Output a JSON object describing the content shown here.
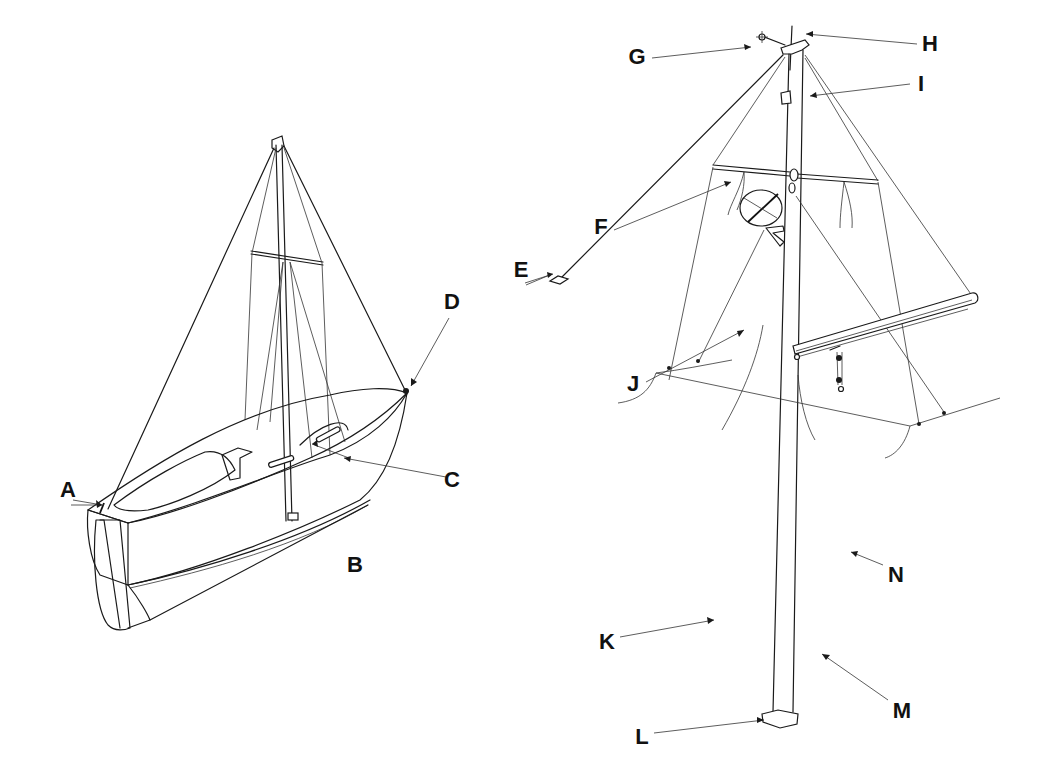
{
  "figure": {
    "colors": {
      "ink": "#1a1a1a",
      "background": "#ffffff"
    }
  },
  "labels": [
    {
      "id": "A",
      "text": "A",
      "x": 68,
      "y": 490
    },
    {
      "id": "B",
      "text": "B",
      "x": 355,
      "y": 565
    },
    {
      "id": "C",
      "text": "C",
      "x": 452,
      "y": 480
    },
    {
      "id": "D",
      "text": "D",
      "x": 452,
      "y": 302
    },
    {
      "id": "E",
      "text": "E",
      "x": 521,
      "y": 270
    },
    {
      "id": "F",
      "text": "F",
      "x": 601,
      "y": 227
    },
    {
      "id": "G",
      "text": "G",
      "x": 637,
      "y": 57
    },
    {
      "id": "H",
      "text": "H",
      "x": 930,
      "y": 44
    },
    {
      "id": "I",
      "text": "I",
      "x": 921,
      "y": 84
    },
    {
      "id": "J",
      "text": "J",
      "x": 633,
      "y": 384
    },
    {
      "id": "K",
      "text": "K",
      "x": 607,
      "y": 642
    },
    {
      "id": "L",
      "text": "L",
      "x": 642,
      "y": 737
    },
    {
      "id": "M",
      "text": "M",
      "x": 902,
      "y": 711
    },
    {
      "id": "N",
      "text": "N",
      "x": 896,
      "y": 575
    }
  ]
}
